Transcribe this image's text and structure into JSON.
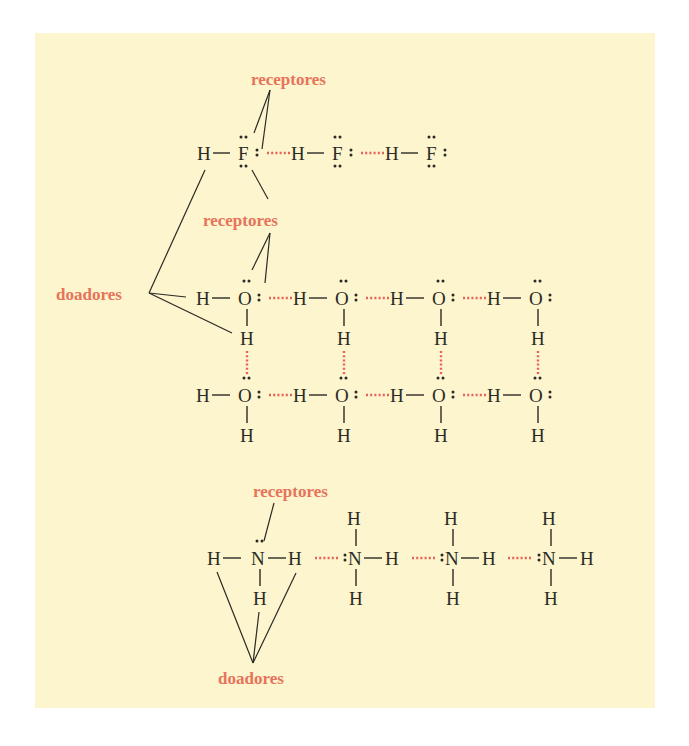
{
  "figure": {
    "background_color": "#fcf5cd",
    "label_color": "#e7735b",
    "hbond_color": "#e8625a",
    "atom_color": "#2b2a26"
  },
  "labels": {
    "hf_receptors": "receptores",
    "water_receptors": "receptores",
    "donors_left": "doadores",
    "ammonia_receptors": "receptores",
    "donors_bottom": "doadores"
  },
  "hf_chain": {
    "molecules": [
      {
        "h": "H",
        "x": "F"
      },
      {
        "h": "H",
        "x": "F"
      },
      {
        "h": "H",
        "x": "F"
      }
    ]
  },
  "water_grid": {
    "row1": [
      {
        "h": "H",
        "o": "O",
        "h2": "H"
      },
      {
        "h": "H",
        "o": "O",
        "h2": "H"
      },
      {
        "h": "H",
        "o": "O",
        "h2": "H"
      },
      {
        "h": "H",
        "o": "O",
        "h2": "H"
      }
    ],
    "row2": [
      {
        "h": "H",
        "o": "O",
        "h2": "H"
      },
      {
        "h": "H",
        "o": "O",
        "h2": "H"
      },
      {
        "h": "H",
        "o": "O",
        "h2": "H"
      },
      {
        "h": "H",
        "o": "O",
        "h2": "H"
      }
    ]
  },
  "ammonia_chain": {
    "first": {
      "h_left": "H",
      "n": "N",
      "h_right": "H",
      "h_bottom": "H"
    },
    "others": [
      {
        "h_top": "H",
        "n": "N",
        "h_right": "H",
        "h_bottom": "H"
      },
      {
        "h_top": "H",
        "n": "N",
        "h_right": "H",
        "h_bottom": "H"
      },
      {
        "h_top": "H",
        "n": "N",
        "h_right": "H",
        "h_bottom": "H"
      }
    ]
  }
}
